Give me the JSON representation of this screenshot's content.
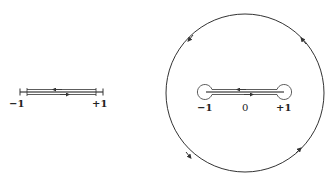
{
  "left_diagram": {
    "description": "Branch cut from -1 to +1 with keyhole contour hugging both sides",
    "labels": {
      "minus_one": "−1",
      "plus_one": "+1"
    }
  },
  "right_diagram": {
    "description": "Large circular contour enclosing a dog-bone contour around the cut [-1, +1]",
    "labels": {
      "minus_one": "−1",
      "zero": "0",
      "plus_one": "+1"
    }
  },
  "colors": {
    "stroke": "#333333",
    "cut": "#888888"
  }
}
